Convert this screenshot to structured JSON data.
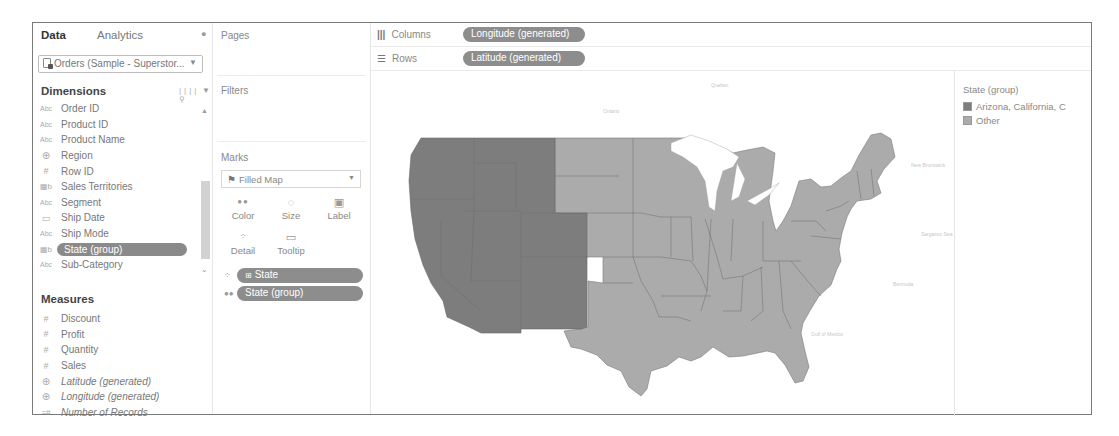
{
  "data_pane": {
    "tabs": [
      {
        "label": "Data",
        "active": true
      },
      {
        "label": "Analytics",
        "active": false
      }
    ],
    "data_source": "Orders (Sample - Superstor...",
    "dimensions_header": "Dimensions",
    "dimensions": [
      {
        "type_icon": "Abc",
        "name": "Order ID"
      },
      {
        "type_icon": "Abc",
        "name": "Product ID"
      },
      {
        "type_icon": "Abc",
        "name": "Product Name"
      },
      {
        "type_icon": "globe",
        "name": "Region"
      },
      {
        "type_icon": "#",
        "name": "Row ID"
      },
      {
        "type_icon": "group",
        "name": "Sales Territories"
      },
      {
        "type_icon": "Abc",
        "name": "Segment"
      },
      {
        "type_icon": "calendar",
        "name": "Ship Date"
      },
      {
        "type_icon": "Abc",
        "name": "Ship Mode"
      },
      {
        "type_icon": "group",
        "name": "State (group)",
        "selected": true
      },
      {
        "type_icon": "Abc",
        "name": "Sub-Category"
      }
    ],
    "measures_header": "Measures",
    "measures": [
      {
        "type_icon": "#",
        "name": "Discount",
        "italic": false
      },
      {
        "type_icon": "#",
        "name": "Profit",
        "italic": false
      },
      {
        "type_icon": "#",
        "name": "Quantity",
        "italic": false
      },
      {
        "type_icon": "#",
        "name": "Sales",
        "italic": false
      },
      {
        "type_icon": "globe",
        "name": "Latitude (generated)",
        "italic": true
      },
      {
        "type_icon": "globe",
        "name": "Longitude (generated)",
        "italic": true
      },
      {
        "type_icon": "=#",
        "name": "Number of Records",
        "italic": true
      }
    ]
  },
  "cards": {
    "pages_title": "Pages",
    "filters_title": "Filters",
    "marks_title": "Marks",
    "mark_type": "Filled Map",
    "mark_buttons": [
      {
        "label": "Color",
        "icon": "color-dots"
      },
      {
        "label": "Size",
        "icon": "size-blob"
      },
      {
        "label": "Label",
        "icon": "label-T"
      },
      {
        "label": "Detail",
        "icon": "detail-dots"
      },
      {
        "label": "Tooltip",
        "icon": "speech-bubble"
      }
    ],
    "mark_pills": [
      {
        "encoding": "detail",
        "label": "State",
        "has_plus": true
      },
      {
        "encoding": "color",
        "label": "State (group)",
        "has_plus": false
      }
    ]
  },
  "shelves": {
    "columns_label": "Columns",
    "columns_pill": "Longitude (generated)",
    "rows_label": "Rows",
    "rows_pill": "Latitude (generated)"
  },
  "legend": {
    "title": "State (group)",
    "items": [
      {
        "label": "Arizona, California, C",
        "color": "#7d7d7d"
      },
      {
        "label": "Other",
        "color": "#ababab"
      }
    ]
  },
  "map": {
    "group_color": "#7d7d7d",
    "other_color": "#ababab",
    "basemap_labels": [
      "Quebec",
      "Ontario",
      "New Brunswick",
      "Nova Scotia",
      "Sargasso Sea",
      "Bermuda",
      "Gulf of Mexico"
    ]
  }
}
